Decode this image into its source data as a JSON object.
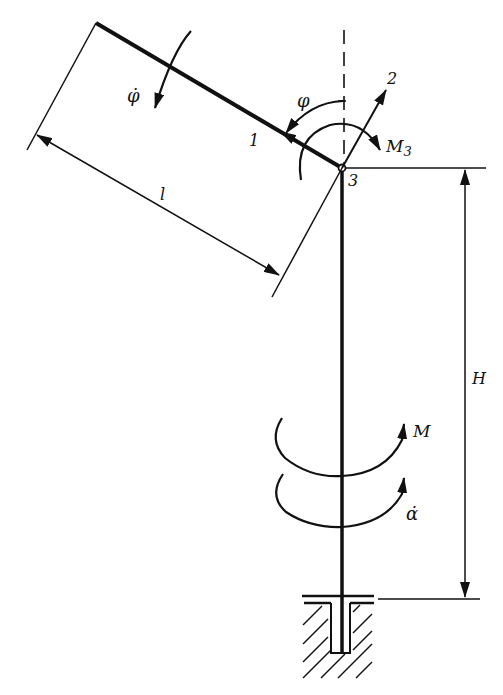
{
  "diagram": {
    "type": "mechanical-schematic",
    "colors": {
      "line": "#111111",
      "background": "#ffffff"
    }
  },
  "labels": {
    "phi_dot": "φ̇",
    "phi": "φ",
    "axis_1": "1",
    "axis_2": "2",
    "node_3": "3",
    "moment_M3": "M",
    "moment_M3_sub": "3",
    "length_l": "l",
    "height_H": "H",
    "moment_M": "M",
    "alpha_dot": "α̇"
  },
  "elements": {
    "arm": {
      "name": "arm",
      "length_label": "l"
    },
    "column": {
      "name": "column",
      "height_label": "H"
    },
    "base": {
      "name": "fixed-base-support"
    }
  }
}
